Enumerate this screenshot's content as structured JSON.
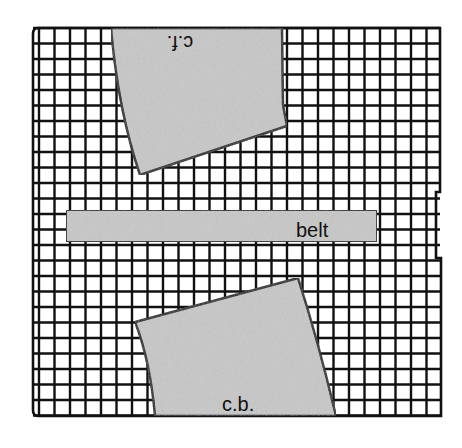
{
  "diagram": {
    "type": "sewing-pattern-cutting-layout",
    "grid": {
      "left": 33,
      "top": 28,
      "right": 440,
      "bottom": 416,
      "selvage_width": 6,
      "cell": 15.5,
      "line_color": "#111111",
      "background": "#ffffff"
    },
    "pieces": [
      {
        "id": "center-front",
        "label": "c.f.",
        "label_rotated": true,
        "fill": "#c8c8c8"
      },
      {
        "id": "belt",
        "label": "belt",
        "fill": "#c8c8c8"
      },
      {
        "id": "center-back",
        "label": "c.b.",
        "fill": "#c8c8c8"
      }
    ]
  }
}
